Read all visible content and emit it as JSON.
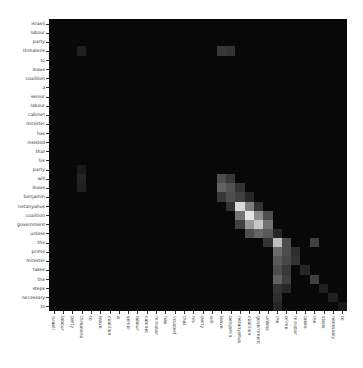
{
  "chart_data": {
    "type": "heatmap",
    "title": "",
    "xlabel": "",
    "ylabel": "",
    "colormap": "grayscale (black=0, white=1)",
    "value_range": [
      0,
      1
    ],
    "grid": false,
    "legend": "none",
    "x_labels": [
      "israeli",
      "labour",
      "party",
      "threatens",
      "to",
      "leave",
      "coalition",
      "a",
      "senior",
      "labour",
      "cabinet",
      "minister",
      "has",
      "insisted",
      "that",
      "his",
      "party",
      "will",
      "leave",
      "benjamin",
      "netanyahus",
      "coalition",
      "government",
      "unless",
      "the",
      "prime",
      "minister",
      "takes",
      "the",
      "steps",
      "necessary",
      "to"
    ],
    "y_labels": [
      "israeli",
      "labour",
      "party",
      "threatens",
      "to",
      "leave",
      "coalition",
      "a",
      "senior",
      "labour",
      "cabinet",
      "minister",
      "has",
      "insisted",
      "that",
      "his",
      "party",
      "will",
      "leave",
      "benjamin",
      "netanyahus",
      "coalition",
      "government",
      "unless",
      "the",
      "prime",
      "minister",
      "takes",
      "the",
      "steps",
      "necessary",
      "to"
    ],
    "highlights": [
      {
        "row": 3,
        "col": 3,
        "value": 0.12
      },
      {
        "row": 3,
        "col": 18,
        "value": 0.22
      },
      {
        "row": 3,
        "col": 19,
        "value": 0.2
      },
      {
        "row": 16,
        "col": 3,
        "value": 0.1
      },
      {
        "row": 17,
        "col": 3,
        "value": 0.14
      },
      {
        "row": 17,
        "col": 18,
        "value": 0.3
      },
      {
        "row": 17,
        "col": 19,
        "value": 0.22
      },
      {
        "row": 18,
        "col": 3,
        "value": 0.12
      },
      {
        "row": 18,
        "col": 18,
        "value": 0.38
      },
      {
        "row": 18,
        "col": 19,
        "value": 0.32
      },
      {
        "row": 18,
        "col": 20,
        "value": 0.2
      },
      {
        "row": 19,
        "col": 18,
        "value": 0.22
      },
      {
        "row": 19,
        "col": 19,
        "value": 0.3
      },
      {
        "row": 19,
        "col": 20,
        "value": 0.25
      },
      {
        "row": 19,
        "col": 21,
        "value": 0.15
      },
      {
        "row": 20,
        "col": 19,
        "value": 0.2
      },
      {
        "row": 20,
        "col": 20,
        "value": 0.85
      },
      {
        "row": 20,
        "col": 21,
        "value": 0.5
      },
      {
        "row": 20,
        "col": 22,
        "value": 0.2
      },
      {
        "row": 21,
        "col": 20,
        "value": 0.45
      },
      {
        "row": 21,
        "col": 21,
        "value": 0.9
      },
      {
        "row": 21,
        "col": 22,
        "value": 0.55
      },
      {
        "row": 21,
        "col": 23,
        "value": 0.3
      },
      {
        "row": 22,
        "col": 20,
        "value": 0.25
      },
      {
        "row": 22,
        "col": 21,
        "value": 0.6
      },
      {
        "row": 22,
        "col": 22,
        "value": 0.78
      },
      {
        "row": 22,
        "col": 23,
        "value": 0.45
      },
      {
        "row": 23,
        "col": 21,
        "value": 0.3
      },
      {
        "row": 23,
        "col": 22,
        "value": 0.4
      },
      {
        "row": 23,
        "col": 23,
        "value": 0.35
      },
      {
        "row": 23,
        "col": 24,
        "value": 0.15
      },
      {
        "row": 24,
        "col": 23,
        "value": 0.2
      },
      {
        "row": 24,
        "col": 24,
        "value": 0.75
      },
      {
        "row": 24,
        "col": 25,
        "value": 0.3
      },
      {
        "row": 24,
        "col": 28,
        "value": 0.25
      },
      {
        "row": 25,
        "col": 24,
        "value": 0.42
      },
      {
        "row": 25,
        "col": 25,
        "value": 0.3
      },
      {
        "row": 25,
        "col": 26,
        "value": 0.18
      },
      {
        "row": 26,
        "col": 24,
        "value": 0.35
      },
      {
        "row": 26,
        "col": 25,
        "value": 0.28
      },
      {
        "row": 26,
        "col": 26,
        "value": 0.2
      },
      {
        "row": 27,
        "col": 24,
        "value": 0.3
      },
      {
        "row": 27,
        "col": 25,
        "value": 0.22
      },
      {
        "row": 27,
        "col": 27,
        "value": 0.15
      },
      {
        "row": 28,
        "col": 24,
        "value": 0.38
      },
      {
        "row": 28,
        "col": 25,
        "value": 0.25
      },
      {
        "row": 28,
        "col": 28,
        "value": 0.25
      },
      {
        "row": 29,
        "col": 24,
        "value": 0.2
      },
      {
        "row": 29,
        "col": 25,
        "value": 0.15
      },
      {
        "row": 29,
        "col": 29,
        "value": 0.12
      },
      {
        "row": 30,
        "col": 24,
        "value": 0.18
      },
      {
        "row": 30,
        "col": 30,
        "value": 0.12
      },
      {
        "row": 31,
        "col": 24,
        "value": 0.15
      },
      {
        "row": 31,
        "col": 31,
        "value": 0.1
      }
    ],
    "background_value": 0.03
  }
}
